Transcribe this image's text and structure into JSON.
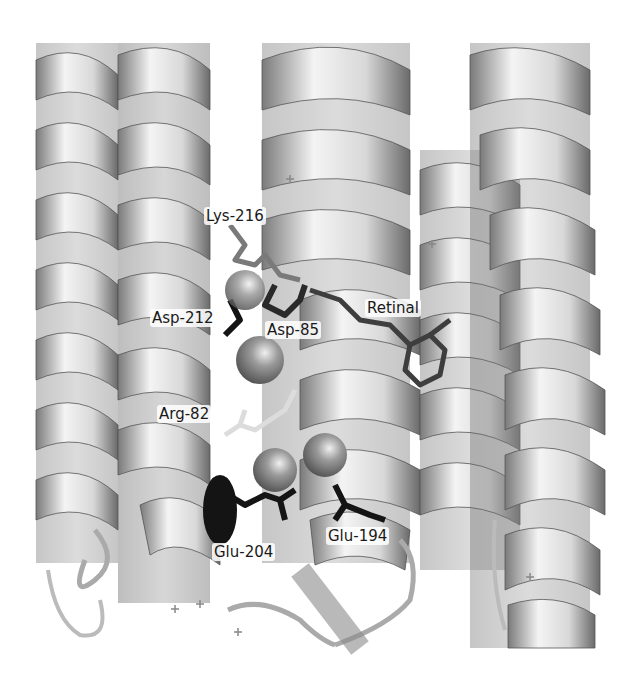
{
  "figure": {
    "colors": {
      "background": "#ffffff",
      "helix_light": "#f2f2f2",
      "helix_mid": "#bdbdbd",
      "helix_dark": "#6e6e6e",
      "helix_inner": "#8a8a8a",
      "residue_black": "#141414",
      "residue_dark": "#4a4a4a",
      "residue_light": "#e6e6e6",
      "sphere": "#8c8c8c"
    },
    "labels": [
      {
        "id": "lys-216",
        "text": "Lys-216",
        "x": 204,
        "y": 207
      },
      {
        "id": "asp-212",
        "text": "Asp-212",
        "x": 150,
        "y": 309
      },
      {
        "id": "asp-85",
        "text": "Asp-85",
        "x": 265,
        "y": 321
      },
      {
        "id": "retinal",
        "text": "Retinal",
        "x": 365,
        "y": 299
      },
      {
        "id": "arg-82",
        "text": "Arg-82",
        "x": 157,
        "y": 405
      },
      {
        "id": "glu-204",
        "text": "Glu-204",
        "x": 212,
        "y": 543
      },
      {
        "id": "glu-194",
        "text": "Glu-194",
        "x": 326,
        "y": 527
      }
    ]
  }
}
